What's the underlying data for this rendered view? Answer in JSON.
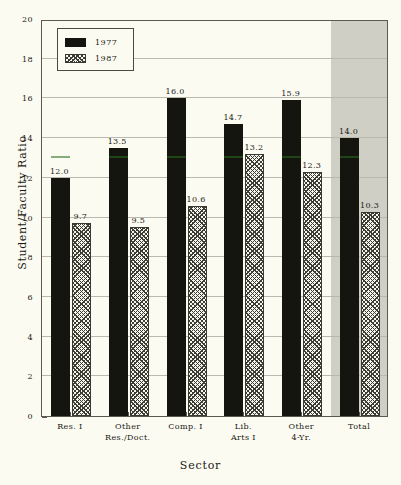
{
  "chart_data": {
    "type": "bar",
    "title": "",
    "xlabel": "Sector",
    "ylabel": "Student/Faculty Ratio",
    "ylim": [
      0,
      20
    ],
    "ytick_step": 2,
    "grid": true,
    "legend_position": "top-left",
    "categories": [
      "Res. I",
      "Other Res./Doct.",
      "Comp. I",
      "Lib. Arts I",
      "Other 4-Yr.",
      "Total"
    ],
    "category_lines": [
      [
        "Res. I",
        ""
      ],
      [
        "Other",
        "Res./Doct."
      ],
      [
        "Comp. I",
        ""
      ],
      [
        "Lib.",
        "Arts I"
      ],
      [
        "Other",
        "4-Yr."
      ],
      [
        "Total",
        ""
      ]
    ],
    "series": [
      {
        "name": "1977",
        "color": "#15150f",
        "fill": "solid",
        "values": [
          12.0,
          13.5,
          16.0,
          14.7,
          15.9,
          14.0
        ],
        "labels": [
          "12.0",
          "13.5",
          "16.0",
          "14.7",
          "15.9",
          "14.0"
        ]
      },
      {
        "name": "1987",
        "color": "#3c3c34",
        "fill": "hatch",
        "values": [
          9.7,
          9.5,
          10.6,
          13.2,
          12.3,
          10.3
        ],
        "labels": [
          "9.7",
          "9.5",
          "10.6",
          "13.2",
          "12.3",
          "10.3"
        ]
      }
    ],
    "ytick_labels": [
      "0",
      "2",
      "4",
      "6",
      "8",
      "10",
      "12",
      "14",
      "16",
      "18",
      "20"
    ],
    "ytick_values": [
      0,
      2,
      4,
      6,
      8,
      10,
      12,
      14,
      16,
      18,
      20
    ],
    "highlight_category": "Total",
    "colors": {
      "background": "#fbfbf2",
      "plot_background": "#fbfbf2",
      "highlight_band": "#cfcfc6",
      "gridline": "#b9b9ae",
      "axis": "#5a5a50",
      "text": "#1a1a14",
      "series_1977": "#15150f",
      "series_1987": "#3c3c34"
    }
  },
  "legend": {
    "entries": [
      {
        "label": "1977",
        "style": "solid-black"
      },
      {
        "label": "1987",
        "style": "diagonal-hatch"
      }
    ]
  }
}
